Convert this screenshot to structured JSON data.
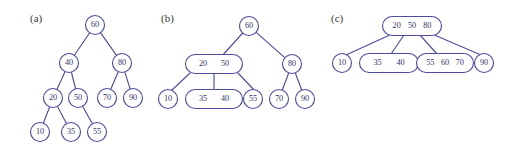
{
  "figure": {
    "background_color": "#ffffff",
    "stroke_color": "#4e4e9e",
    "text_color": "#33336b",
    "label_color": "#3a3a3a",
    "panels": [
      {
        "id": "a",
        "label": "(a)",
        "label_x": 30,
        "label_y": 22,
        "tree_type": "binary-search-tree",
        "nodes": [
          {
            "id": "a-60",
            "keys": [
              "60"
            ],
            "cx": 95,
            "cy": 25,
            "shape": "circle",
            "rx": 9.5,
            "ry": 9.5
          },
          {
            "id": "a-40",
            "keys": [
              "40"
            ],
            "cx": 69,
            "cy": 63,
            "shape": "circle",
            "rx": 9.5,
            "ry": 9.5
          },
          {
            "id": "a-80",
            "keys": [
              "80"
            ],
            "cx": 122,
            "cy": 63,
            "shape": "circle",
            "rx": 9.5,
            "ry": 9.5
          },
          {
            "id": "a-20",
            "keys": [
              "20"
            ],
            "cx": 53,
            "cy": 98,
            "shape": "circle",
            "rx": 9.5,
            "ry": 9.5
          },
          {
            "id": "a-50",
            "keys": [
              "50"
            ],
            "cx": 78,
            "cy": 98,
            "shape": "circle",
            "rx": 9.5,
            "ry": 9.5
          },
          {
            "id": "a-70",
            "keys": [
              "70"
            ],
            "cx": 107,
            "cy": 98,
            "shape": "circle",
            "rx": 9.5,
            "ry": 9.5
          },
          {
            "id": "a-90",
            "keys": [
              "90"
            ],
            "cx": 133,
            "cy": 98,
            "shape": "circle",
            "rx": 9.5,
            "ry": 9.5
          },
          {
            "id": "a-10",
            "keys": [
              "10"
            ],
            "cx": 40,
            "cy": 132,
            "shape": "circle",
            "rx": 9.5,
            "ry": 9.5
          },
          {
            "id": "a-35",
            "keys": [
              "35"
            ],
            "cx": 71,
            "cy": 132,
            "shape": "circle",
            "rx": 9.5,
            "ry": 9.5
          },
          {
            "id": "a-55",
            "keys": [
              "55"
            ],
            "cx": 97,
            "cy": 132,
            "shape": "circle",
            "rx": 9.5,
            "ry": 9.5
          }
        ],
        "edges": [
          {
            "from": "a-60",
            "to": "a-40"
          },
          {
            "from": "a-60",
            "to": "a-80"
          },
          {
            "from": "a-40",
            "to": "a-20"
          },
          {
            "from": "a-40",
            "to": "a-50"
          },
          {
            "from": "a-80",
            "to": "a-70"
          },
          {
            "from": "a-80",
            "to": "a-90"
          },
          {
            "from": "a-20",
            "to": "a-10"
          },
          {
            "from": "a-20",
            "to": "a-35"
          },
          {
            "from": "a-50",
            "to": "a-55"
          }
        ]
      },
      {
        "id": "b",
        "label": "(b)",
        "label_x": 161,
        "label_y": 22,
        "tree_type": "2-3-tree-partial",
        "nodes": [
          {
            "id": "b-60",
            "keys": [
              "60"
            ],
            "cx": 249,
            "cy": 26,
            "shape": "circle",
            "rx": 9.5,
            "ry": 9.5
          },
          {
            "id": "b-20-50",
            "keys": [
              "20",
              "50"
            ],
            "cx": 214,
            "cy": 64,
            "shape": "rrect",
            "rx": 28.5,
            "ry": 9.5
          },
          {
            "id": "b-80",
            "keys": [
              "80"
            ],
            "cx": 292,
            "cy": 64,
            "shape": "circle",
            "rx": 9.5,
            "ry": 9.5
          },
          {
            "id": "b-10",
            "keys": [
              "10"
            ],
            "cx": 168,
            "cy": 99,
            "shape": "circle",
            "rx": 9.5,
            "ry": 9.5
          },
          {
            "id": "b-35-40",
            "keys": [
              "35",
              "40"
            ],
            "cx": 214,
            "cy": 99,
            "shape": "rrect",
            "rx": 28.5,
            "ry": 9.5
          },
          {
            "id": "b-55",
            "keys": [
              "55"
            ],
            "cx": 253,
            "cy": 99,
            "shape": "circle",
            "rx": 9.5,
            "ry": 9.5
          },
          {
            "id": "b-70",
            "keys": [
              "70"
            ],
            "cx": 279,
            "cy": 99,
            "shape": "circle",
            "rx": 9.5,
            "ry": 9.5
          },
          {
            "id": "b-90",
            "keys": [
              "90"
            ],
            "cx": 305,
            "cy": 99,
            "shape": "circle",
            "rx": 9.5,
            "ry": 9.5
          }
        ],
        "edges": [
          {
            "from": "b-60",
            "to": "b-20-50",
            "from_x": 249,
            "from_y": 26,
            "to_x": 222,
            "to_y": 56
          },
          {
            "from": "b-60",
            "to": "b-80"
          },
          {
            "from": "b-20-50",
            "to": "b-10",
            "from_x": 190,
            "from_y": 73,
            "to_x": 171,
            "to_y": 91
          },
          {
            "from": "b-20-50",
            "to": "b-35-40",
            "from_x": 214,
            "from_y": 73,
            "to_x": 214,
            "to_y": 90
          },
          {
            "from": "b-20-50",
            "to": "b-55",
            "from_x": 238,
            "from_y": 73,
            "to_x": 255,
            "to_y": 91
          },
          {
            "from": "b-80",
            "to": "b-70"
          },
          {
            "from": "b-80",
            "to": "b-90"
          }
        ]
      },
      {
        "id": "c",
        "label": "(c)",
        "label_x": 331,
        "label_y": 22,
        "tree_type": "b-tree",
        "nodes": [
          {
            "id": "c-20-50-80",
            "keys": [
              "20",
              "50",
              "80"
            ],
            "cx": 412,
            "cy": 26,
            "shape": "rrect",
            "rx": 29.5,
            "ry": 9.5
          },
          {
            "id": "c-10",
            "keys": [
              "10"
            ],
            "cx": 342,
            "cy": 63,
            "shape": "circle",
            "rx": 9.5,
            "ry": 9.5
          },
          {
            "id": "c-35-40",
            "keys": [
              "35",
              "40"
            ],
            "cx": 389,
            "cy": 63,
            "shape": "rrect",
            "rx": 29.5,
            "ry": 9.5
          },
          {
            "id": "c-55-60-70",
            "keys": [
              "55",
              "60",
              "70"
            ],
            "cx": 445,
            "cy": 63,
            "shape": "rrect",
            "rx": 28.5,
            "ry": 9.5
          },
          {
            "id": "c-90",
            "keys": [
              "90"
            ],
            "cx": 484,
            "cy": 63,
            "shape": "circle",
            "rx": 9.5,
            "ry": 9.5
          }
        ],
        "edges": [
          {
            "from": "c-20-50-80",
            "to": "c-10",
            "from_x": 392,
            "from_y": 34,
            "to_x": 346,
            "to_y": 55
          },
          {
            "from": "c-20-50-80",
            "to": "c-35-40",
            "from_x": 404,
            "from_y": 35,
            "to_x": 391,
            "to_y": 54
          },
          {
            "from": "c-20-50-80",
            "to": "c-55-60-70",
            "from_x": 420,
            "from_y": 35,
            "to_x": 437,
            "to_y": 54
          },
          {
            "from": "c-20-50-80",
            "to": "c-90",
            "from_x": 432,
            "from_y": 34,
            "to_x": 481,
            "to_y": 55
          }
        ]
      }
    ]
  },
  "chart_data": {
    "type": "diagram",
    "title": "",
    "subtitle": "",
    "keys": [
      "10",
      "20",
      "35",
      "40",
      "50",
      "55",
      "60",
      "70",
      "80",
      "90"
    ],
    "panels": [
      {
        "label": "(a)",
        "type": "binary-search-tree",
        "levels": [
          [
            "60"
          ],
          [
            "40",
            "80"
          ],
          [
            "20",
            "50",
            "70",
            "90"
          ],
          [
            "10",
            "35",
            "55"
          ]
        ],
        "edges": [
          [
            "60",
            "40"
          ],
          [
            "60",
            "80"
          ],
          [
            "40",
            "20"
          ],
          [
            "40",
            "50"
          ],
          [
            "80",
            "70"
          ],
          [
            "80",
            "90"
          ],
          [
            "20",
            "10"
          ],
          [
            "20",
            "35"
          ],
          [
            "50",
            "55"
          ]
        ]
      },
      {
        "label": "(b)",
        "type": "2-3-tree",
        "levels": [
          [
            [
              "60"
            ]
          ],
          [
            [
              "20",
              "50"
            ],
            [
              "80"
            ]
          ],
          [
            [
              "10"
            ],
            [
              "35",
              "40"
            ],
            [
              "55"
            ],
            [
              "70"
            ],
            [
              "90"
            ]
          ]
        ],
        "edges": [
          [
            "60",
            "20 50"
          ],
          [
            "60",
            "80"
          ],
          [
            "20 50",
            "10"
          ],
          [
            "20 50",
            "35 40"
          ],
          [
            "20 50",
            "55"
          ],
          [
            "80",
            "70"
          ],
          [
            "80",
            "90"
          ]
        ]
      },
      {
        "label": "(c)",
        "type": "b-tree",
        "levels": [
          [
            [
              "20",
              "50",
              "80"
            ]
          ],
          [
            [
              "10"
            ],
            [
              "35",
              "40"
            ],
            [
              "55",
              "60",
              "70"
            ],
            [
              "90"
            ]
          ]
        ],
        "edges": [
          [
            "20 50 80",
            "10"
          ],
          [
            "20 50 80",
            "35 40"
          ],
          [
            "20 50 80",
            "55 60 70"
          ],
          [
            "20 50 80",
            "90"
          ]
        ]
      }
    ]
  }
}
